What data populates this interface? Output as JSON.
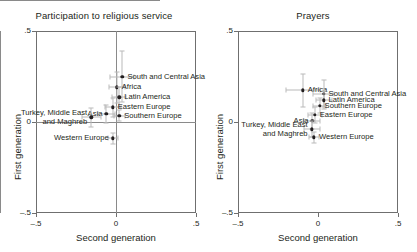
{
  "figure": {
    "width": 417,
    "height": 252,
    "background": "#ffffff",
    "marker_color": "#231f20",
    "errorbar_color": "#b9b9b9",
    "frame_color": "#6f6f6f"
  },
  "chart_data": [
    {
      "type": "scatter",
      "panel": "left",
      "title": "Participation to religious service",
      "xlabel": "Second generation",
      "ylabel": "First generation",
      "xlim": [
        -0.5,
        0.5
      ],
      "ylim": [
        -0.5,
        0.5
      ],
      "xticks": [
        -0.5,
        0,
        0.5
      ],
      "xticklabels": [
        "–.5",
        "0",
        ".5"
      ],
      "yticks": [
        -0.5,
        0,
        0.5
      ],
      "yticklabels": [
        "–.5",
        "0",
        ".5"
      ],
      "grid": false,
      "reference_lines": {
        "x": 0,
        "y": 0
      },
      "legend": "none",
      "points": [
        {
          "label": "South and Central Asia",
          "x": 0.04,
          "y": 0.25,
          "label_pos": "right",
          "xerr": 0.075,
          "yerr": 0.14
        },
        {
          "label": "Africa",
          "x": 0.005,
          "y": 0.19,
          "label_pos": "right",
          "xerr": 0.05,
          "yerr": 0.085
        },
        {
          "label": "Latin America",
          "x": 0.02,
          "y": 0.135,
          "label_pos": "right",
          "xerr": 0.045,
          "yerr": 0.055
        },
        {
          "label": "Eastern Europe",
          "x": -0.02,
          "y": 0.08,
          "label_pos": "right",
          "xerr": 0.05,
          "yerr": 0.05
        },
        {
          "label": "Southern Europe",
          "x": 0.02,
          "y": 0.035,
          "label_pos": "right",
          "xerr": 0.035,
          "yerr": 0.03
        },
        {
          "label": "Asia",
          "x": -0.06,
          "y": 0.045,
          "label_pos": "left",
          "xerr": 0.055,
          "yerr": 0.05
        },
        {
          "label": "Turkey, Middle East\nand Maghreb",
          "x": -0.155,
          "y": 0.025,
          "label_pos": "left",
          "xerr": 0.06,
          "yerr": 0.05
        },
        {
          "label": "Western Europe",
          "x": -0.02,
          "y": -0.09,
          "label_pos": "left",
          "xerr": 0.03,
          "yerr": 0.03
        }
      ]
    },
    {
      "type": "scatter",
      "panel": "right",
      "title": "Prayers",
      "xlabel": "Second generation",
      "ylabel": "First generation",
      "xlim": [
        -0.5,
        0.5
      ],
      "ylim": [
        -0.5,
        0.5
      ],
      "xticks": [
        -0.5,
        0,
        0.5
      ],
      "xticklabels": [
        "–.5",
        "0",
        ".5"
      ],
      "yticks": [
        -0.5,
        0,
        0.5
      ],
      "yticklabels": [
        "–.5",
        "0",
        ".5"
      ],
      "grid": false,
      "reference_lines": {
        "x": 0,
        "y": 0
      },
      "legend": "none",
      "points": [
        {
          "label": "Africa",
          "x": -0.095,
          "y": 0.175,
          "label_pos": "right",
          "xerr": 0.105,
          "yerr": 0.09
        },
        {
          "label": "South and Central Asia",
          "x": 0.035,
          "y": 0.155,
          "label_pos": "right",
          "xerr": 0.065,
          "yerr": 0.075
        },
        {
          "label": "Latin America",
          "x": 0.035,
          "y": 0.12,
          "label_pos": "right",
          "xerr": 0.05,
          "yerr": 0.05
        },
        {
          "label": "Southern Europe",
          "x": 0.01,
          "y": 0.09,
          "label_pos": "right",
          "xerr": 0.04,
          "yerr": 0.04
        },
        {
          "label": "Eastern Europe",
          "x": -0.02,
          "y": 0.04,
          "label_pos": "right",
          "xerr": 0.045,
          "yerr": 0.045
        },
        {
          "label": "Asia",
          "x": -0.035,
          "y": 0.005,
          "label_pos": "left",
          "xerr": 0.05,
          "yerr": 0.045
        },
        {
          "label": "Turkey, Middle East\nand Maghreb",
          "x": -0.04,
          "y": -0.04,
          "label_pos": "left",
          "xerr": 0.05,
          "yerr": 0.045
        },
        {
          "label": "Western Europe",
          "x": -0.025,
          "y": -0.085,
          "label_pos": "right",
          "xerr": 0.03,
          "yerr": 0.03
        }
      ]
    }
  ]
}
